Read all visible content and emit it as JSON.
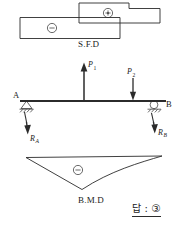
{
  "figure": {
    "type": "engineering-beam-diagram",
    "ink_color": "#2b2b2b",
    "background_color": "#ffffff"
  },
  "sfd": {
    "label": "S.F.D",
    "positive_region_sign": "⊕",
    "negative_region_sign": "⊖",
    "negative_block": {
      "x": 20,
      "y": 17,
      "width": 100,
      "height": 21
    },
    "positive_block_outline": "stepped polygon rising above the baseline from midspan to the right end"
  },
  "beam": {
    "support_a_label": "A",
    "support_b_label": "B",
    "support_a_type": "pinned-hinge",
    "support_b_type": "roller",
    "reaction_a_label": "R",
    "reaction_a_sub": "A",
    "reaction_b_label": "R",
    "reaction_b_sub": "B",
    "reaction_a_direction": "down",
    "reaction_b_direction": "down",
    "load_p1_label": "P",
    "load_p1_sub": "1",
    "load_p1_direction": "up",
    "load_p2_label": "P",
    "load_p2_sub": "2",
    "load_p2_direction": "down",
    "span_x_start": 20,
    "span_x_end": 166,
    "baseline_y": 101
  },
  "bmd": {
    "label": "B.M.D",
    "sign": "⊖",
    "shape": "triangle with apex below the baseline near midspan",
    "left_x": 26,
    "right_x": 162,
    "baseline_y": 158,
    "apex_x": 78,
    "apex_y": 190
  },
  "answer": {
    "prefix": "답",
    "separator": ":",
    "choice": "③",
    "full_text": "답 : ③"
  }
}
